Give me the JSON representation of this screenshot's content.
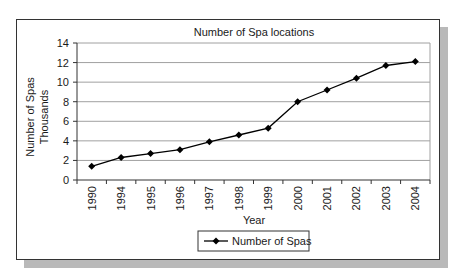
{
  "chart_data": {
    "type": "line",
    "title": "Number of Spa locations",
    "xlabel": "Year",
    "ylabel": [
      "Number of Spas",
      "Thousands"
    ],
    "categories": [
      "1990",
      "1994",
      "1995",
      "1996",
      "1997",
      "1998",
      "1999",
      "2000",
      "2001",
      "2002",
      "2003",
      "2004"
    ],
    "series": [
      {
        "name": "Number of Spas",
        "marker": "diamond",
        "color": "#000000",
        "values": [
          1.4,
          2.3,
          2.7,
          3.1,
          3.9,
          4.6,
          5.3,
          8.0,
          9.2,
          10.4,
          11.7,
          12.1
        ]
      }
    ],
    "ylim": [
      0,
      14
    ],
    "yticks": [
      0,
      2,
      4,
      6,
      8,
      10,
      12,
      14
    ],
    "grid": {
      "horizontal": true,
      "vertical": false,
      "color": "#999999"
    },
    "legend": {
      "position": "bottom",
      "entries": [
        "Number of Spas"
      ]
    }
  },
  "colors": {
    "line": "#000000",
    "grid": "#a0a0a0",
    "frame": "#333333",
    "shadow": "#b9b9b9"
  }
}
